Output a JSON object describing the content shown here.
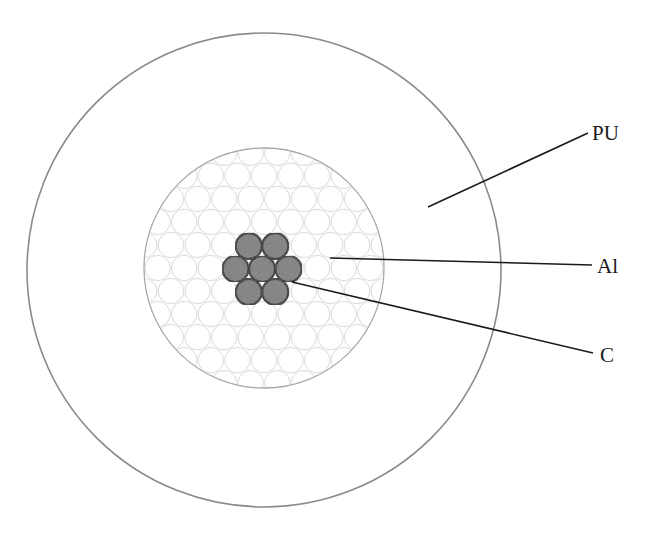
{
  "diagram": {
    "outer_layer": {
      "label": "PU",
      "cx": 264,
      "cy": 270,
      "r": 237,
      "stroke": "#8a8a8a"
    },
    "middle_layer": {
      "label": "Al",
      "cx": 264,
      "cy": 268,
      "r": 120,
      "stroke": "#a8a8a8",
      "strand_stroke": "#d8d8d8",
      "strand_r": 13.3,
      "strand_pitch": 26.6
    },
    "core": {
      "label": "C",
      "fill": "#7d7d7d",
      "stroke": "#222222",
      "strand_count": 7,
      "strand_r": 13
    },
    "leaders": [
      {
        "id": "pu",
        "label": "PU",
        "x1": 428,
        "y1": 207,
        "x2": 588,
        "y2": 133,
        "tx": 592,
        "ty": 140
      },
      {
        "id": "al",
        "label": "Al",
        "x1": 330,
        "y1": 258,
        "x2": 592,
        "y2": 265,
        "tx": 597,
        "ty": 273
      },
      {
        "id": "c",
        "label": "C",
        "x1": 292,
        "y1": 282,
        "x2": 593,
        "y2": 353,
        "tx": 600,
        "ty": 362
      }
    ]
  }
}
